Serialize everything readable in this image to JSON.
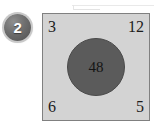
{
  "badge": {
    "label": "2",
    "icon": "numbered-step-badge",
    "color": "#6e6e6e"
  },
  "artifact": {
    "name": "faint-scan-line"
  },
  "panel": {
    "background_color": "#d3d3d3",
    "border_color": "#808080",
    "corners": {
      "top_left": "3",
      "top_right": "12",
      "bottom_left": "6",
      "bottom_right": "5"
    },
    "center": {
      "label": "48",
      "fill_color": "#5b5b5b",
      "text_color": "#141414"
    }
  }
}
